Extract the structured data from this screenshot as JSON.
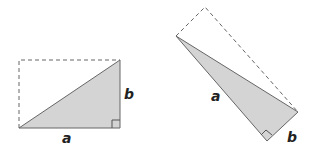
{
  "figures": [
    {
      "name": "horizontal-right-triangle",
      "labels": {
        "a": "a",
        "b": "b"
      }
    },
    {
      "name": "rotated-right-triangle",
      "labels": {
        "a": "a",
        "b": "b"
      }
    }
  ],
  "colors": {
    "fill": "#d4d4d4",
    "stroke": "#666666",
    "dashed": "#666666",
    "label": "#222222"
  }
}
